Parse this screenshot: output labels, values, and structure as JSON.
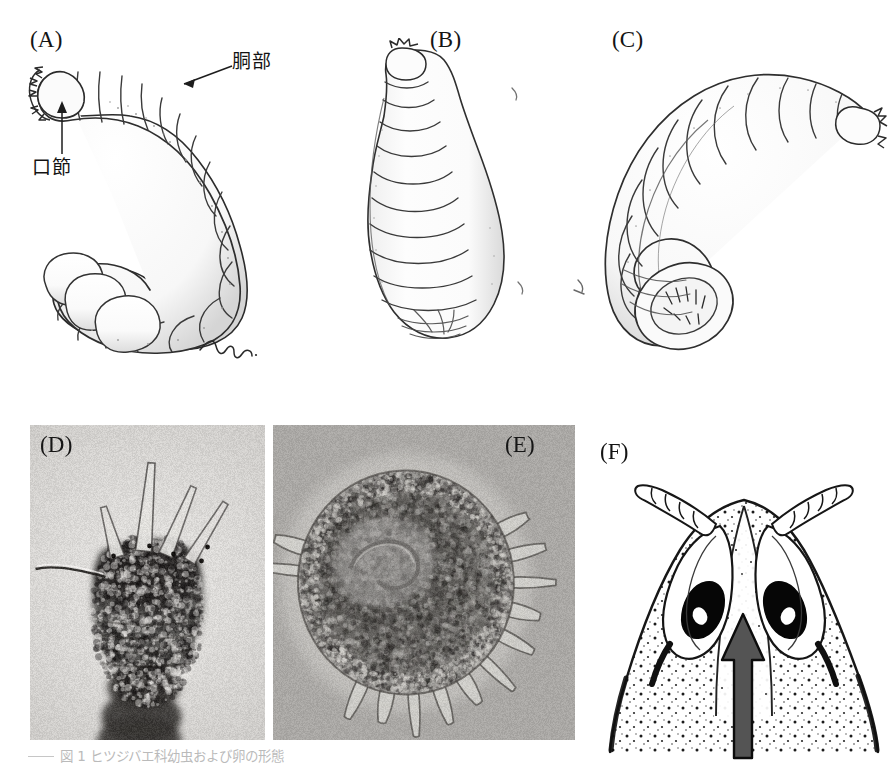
{
  "figure": {
    "background_color": "#ffffff",
    "width": 888,
    "height": 765,
    "kind": "scientific-plate"
  },
  "panels": [
    {
      "id": "A",
      "label": "(A)",
      "type": "line-drawing",
      "subject": "C-shaped curled fly larva, lateral view, segmented body with mouth hooks at anterior end",
      "signature": "mori",
      "x": 30,
      "y": 28
    },
    {
      "id": "B",
      "label": "(B)",
      "type": "line-drawing",
      "subject": "Elongate upright fly larva, dorsal view, segmented body, broad posterior end",
      "x": 430,
      "y": 28
    },
    {
      "id": "C",
      "label": "(C)",
      "type": "line-drawing",
      "subject": "Curled fly larva with posterior spiracular plate visible",
      "x": 612,
      "y": 28
    },
    {
      "id": "D",
      "label": "(D)",
      "type": "micrograph",
      "subject": "Light micrograph of larval head capsule with paired horn-like processes and antennae",
      "background_color": "#d7d5d2",
      "x": 30,
      "y": 425,
      "w": 235,
      "h": 315
    },
    {
      "id": "E",
      "label": "(E)",
      "type": "micrograph",
      "subject": "Light micrograph of spherical egg bearing a crown of chorionic spines",
      "background_color": "#a8a6a3",
      "x": 273,
      "y": 425,
      "w": 302,
      "h": 315
    },
    {
      "id": "F",
      "label": "(F)",
      "type": "line-drawing",
      "subject": "Stippled ink drawing of adult head, frontal view, with compound eyes, antennae and a gray arrow indicating the frontal suture",
      "arrow_color": "#545454",
      "x": 600,
      "y": 440
    }
  ],
  "callouts": [
    {
      "id": "dobu",
      "text": "胴部",
      "meaning_panel": "A",
      "x": 232,
      "y": 52,
      "arrow": {
        "from_x": 228,
        "from_y": 68,
        "to_x": 180,
        "to_y": 86
      }
    },
    {
      "id": "kousetsu",
      "text": "口節",
      "meaning_panel": "A",
      "x": 32,
      "y": 158,
      "arrow": {
        "from_x": 60,
        "from_y": 152,
        "to_x": 60,
        "to_y": 103
      }
    }
  ],
  "caption": {
    "rule": "",
    "text": "図 1   ヒツジバエ科幼虫および卵の形態",
    "visible": "partially cropped at image bottom edge"
  }
}
